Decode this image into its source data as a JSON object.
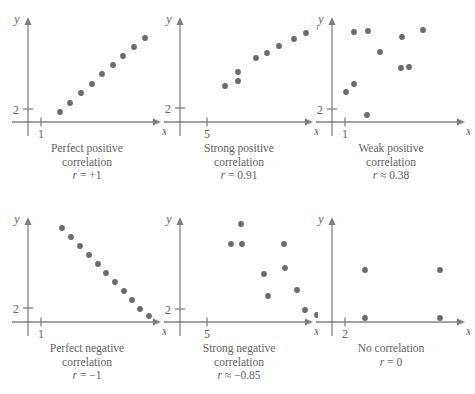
{
  "figure": {
    "axis_label_x": "x",
    "axis_label_y": "y",
    "dot_color": "#6b6b6b",
    "axis_color": "#808080",
    "text_color": "#636363"
  },
  "panels": [
    {
      "id": "perfect-positive",
      "caption_line1": "Perfect positive",
      "caption_line2": "correlation",
      "r_symbol": "r",
      "r_text": " = +1",
      "r_value": 1,
      "x_tick_label": "1",
      "y_tick_label": "2",
      "x_axis_label": "x",
      "y_axis_label": "y"
    },
    {
      "id": "strong-positive",
      "caption_line1": "Strong positive",
      "caption_line2": "correlation",
      "r_symbol": "r",
      "r_text": " = 0.91",
      "r_value": 0.91,
      "x_tick_label": "5",
      "y_tick_label": "2",
      "x_axis_label": "x",
      "y_axis_label": "y"
    },
    {
      "id": "weak-positive",
      "caption_line1": "Weak positive",
      "caption_line2": "correlation",
      "r_symbol": "r",
      "r_text": " ≈ 0.38",
      "r_value": 0.38,
      "x_tick_label": "1",
      "y_tick_label": "2",
      "x_axis_label": "x",
      "y_axis_label": "y"
    },
    {
      "id": "perfect-negative",
      "caption_line1": "Perfect negative",
      "caption_line2": "correlation",
      "r_symbol": "r",
      "r_text": " = −1",
      "r_value": -1,
      "x_tick_label": "1",
      "y_tick_label": "2",
      "x_axis_label": "x",
      "y_axis_label": "y"
    },
    {
      "id": "strong-negative",
      "caption_line1": "Strong negative",
      "caption_line2": "correlation",
      "r_symbol": "r",
      "r_text": " ≈ −0.85",
      "r_value": -0.85,
      "x_tick_label": "5",
      "y_tick_label": "2",
      "x_axis_label": "x",
      "y_axis_label": "y"
    },
    {
      "id": "no-correlation",
      "caption_line1": "No correlation",
      "caption_line2": "",
      "r_symbol": "r",
      "r_text": " = 0",
      "r_value": 0,
      "x_tick_label": "2",
      "y_tick_label": "",
      "x_axis_label": "x",
      "y_axis_label": "y"
    }
  ],
  "chart_data": [
    {
      "type": "scatter",
      "title": "Perfect positive correlation",
      "annotation": "r = +1",
      "xlabel": "x",
      "ylabel": "y",
      "x_ticks": [
        {
          "label": "1",
          "px": 33
        }
      ],
      "y_ticks": [
        {
          "label": "2",
          "px": 103
        }
      ],
      "points": [
        {
          "x": 32,
          "y": 106
        },
        {
          "x": 42,
          "y": 97
        },
        {
          "x": 53,
          "y": 87
        },
        {
          "x": 64,
          "y": 78
        },
        {
          "x": 74,
          "y": 68
        },
        {
          "x": 85,
          "y": 59
        },
        {
          "x": 95,
          "y": 50
        },
        {
          "x": 106,
          "y": 41
        },
        {
          "x": 117,
          "y": 32
        }
      ]
    },
    {
      "type": "scatter",
      "title": "Strong positive correlation",
      "annotation": "r = 0.91",
      "xlabel": "x",
      "ylabel": "y",
      "x_ticks": [
        {
          "label": "5",
          "px": 47
        }
      ],
      "y_ticks": [
        {
          "label": "2",
          "px": 102
        }
      ],
      "points": [
        {
          "x": 45,
          "y": 80
        },
        {
          "x": 58,
          "y": 75
        },
        {
          "x": 58,
          "y": 66
        },
        {
          "x": 76,
          "y": 52
        },
        {
          "x": 87,
          "y": 47
        },
        {
          "x": 99,
          "y": 40
        },
        {
          "x": 114,
          "y": 33
        },
        {
          "x": 126,
          "y": 27
        },
        {
          "x": 140,
          "y": 22
        }
      ]
    },
    {
      "type": "scatter",
      "title": "Weak positive correlation",
      "annotation": "r ≈ 0.38",
      "xlabel": "x",
      "ylabel": "y",
      "x_ticks": [
        {
          "label": "1",
          "px": 33
        }
      ],
      "y_ticks": [
        {
          "label": "2",
          "px": 103
        }
      ],
      "points": [
        {
          "x": 22,
          "y": 26
        },
        {
          "x": 36,
          "y": 25
        },
        {
          "x": 48,
          "y": 46
        },
        {
          "x": 70,
          "y": 31
        },
        {
          "x": 69,
          "y": 62
        },
        {
          "x": 77,
          "y": 61
        },
        {
          "x": 91,
          "y": 24
        },
        {
          "x": 22,
          "y": 78
        },
        {
          "x": 14,
          "y": 86
        },
        {
          "x": 35,
          "y": 109
        }
      ]
    },
    {
      "type": "scatter",
      "title": "Perfect negative correlation",
      "annotation": "r = −1",
      "xlabel": "x",
      "ylabel": "y",
      "x_ticks": [
        {
          "label": "1",
          "px": 33
        }
      ],
      "y_ticks": [
        {
          "label": "2",
          "px": 102
        }
      ],
      "points": [
        {
          "x": 34,
          "y": 22
        },
        {
          "x": 43,
          "y": 31
        },
        {
          "x": 52,
          "y": 40
        },
        {
          "x": 61,
          "y": 49
        },
        {
          "x": 70,
          "y": 58
        },
        {
          "x": 78,
          "y": 67
        },
        {
          "x": 87,
          "y": 76
        },
        {
          "x": 96,
          "y": 85
        },
        {
          "x": 104,
          "y": 94
        },
        {
          "x": 112,
          "y": 103
        },
        {
          "x": 121,
          "y": 110
        }
      ]
    },
    {
      "type": "scatter",
      "title": "Strong negative correlation",
      "annotation": "r ≈ −0.85",
      "xlabel": "x",
      "ylabel": "y",
      "x_ticks": [
        {
          "label": "5",
          "px": 47
        }
      ],
      "y_ticks": [
        {
          "label": "2",
          "px": 103
        }
      ],
      "points": [
        {
          "x": 61,
          "y": 18
        },
        {
          "x": 51,
          "y": 38
        },
        {
          "x": 62,
          "y": 38
        },
        {
          "x": 104,
          "y": 38
        },
        {
          "x": 105,
          "y": 62
        },
        {
          "x": 84,
          "y": 68
        },
        {
          "x": 117,
          "y": 84
        },
        {
          "x": 88,
          "y": 90
        },
        {
          "x": 125,
          "y": 104
        },
        {
          "x": 137,
          "y": 109
        }
      ]
    },
    {
      "type": "scatter",
      "title": "No correlation",
      "annotation": "r = 0",
      "xlabel": "x",
      "ylabel": "y",
      "x_ticks": [
        {
          "label": "2",
          "px": 33
        }
      ],
      "y_ticks": [],
      "points": [
        {
          "x": 33,
          "y": 64
        },
        {
          "x": 108,
          "y": 64
        },
        {
          "x": 33,
          "y": 112
        },
        {
          "x": 108,
          "y": 112
        }
      ]
    }
  ]
}
